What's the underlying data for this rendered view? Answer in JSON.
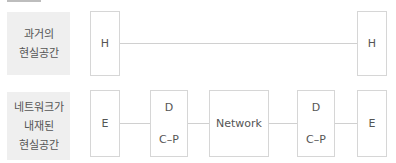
{
  "rows": [
    {
      "label_lines": [
        "과거의",
        "현실공간"
      ],
      "nodes": [
        {
          "text": "H"
        },
        {
          "text": "H"
        }
      ]
    },
    {
      "label_lines": [
        "네트워크가",
        "내재된",
        "현실공간"
      ],
      "nodes": [
        {
          "text": "E"
        },
        {
          "top": "D",
          "bottom": "C–P"
        },
        {
          "text": "Network"
        },
        {
          "top": "D",
          "bottom": "C–P"
        },
        {
          "text": "E"
        }
      ]
    }
  ]
}
